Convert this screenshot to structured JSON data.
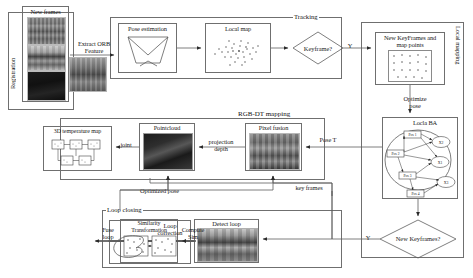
{
  "diagram": {
    "groups": {
      "registration": "Registration",
      "tracking": "Tracking",
      "local_mapping": "Local mapping",
      "rgbdt_mapping": "RGB-DT mapping",
      "loop_closing": "Loop closing"
    },
    "blocks": {
      "new_frames": "New frames",
      "pose_estimation": "Pose estimation",
      "local_map": "Local map",
      "keyframe_decision": "Keyframe?",
      "new_keyframes_map_points": "New KeyFrames and\nmap points",
      "local_ba": "Locla BA",
      "new_keyframes_decision": "New Keyframes?",
      "pixel_fusion": "Pixel fusion",
      "pointcloud": "Pointcloud",
      "temperature_map": "3D temperature map",
      "detect_loop": "Detect loop",
      "similarity_transformation": "Similarity\nTransformation",
      "loop_correction": "Loop\ncorrection"
    },
    "edges": {
      "extract_orb": "Extract ORB\nFeature",
      "keyframe_yes": "Y",
      "optimize_pose": "Optimize\npose",
      "new_keyframes_yes": "Y",
      "pose_t": "Pose T",
      "key_frames": "key frames",
      "projection_depth": "projection\ndepth",
      "joint": "joint",
      "optimized_pose": "Optimized pose",
      "compute_sim": "Compute\nSim",
      "fuse_loop": "Fuse\nloop"
    },
    "ba_graph": {
      "pose_nodes": [
        "Pos 1",
        "Pos 2",
        "Pos 3",
        "Pos 4"
      ],
      "landmark_nodes": [
        "X2",
        "X1",
        "X3"
      ]
    },
    "colors": {
      "stroke": "#5d5d5d",
      "text": "#1a1a1a",
      "background": "#ffffff"
    }
  }
}
